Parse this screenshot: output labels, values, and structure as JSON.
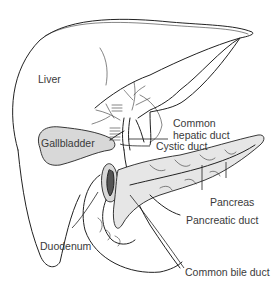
{
  "diagram": {
    "type": "anatomical-illustration",
    "labels": {
      "liver": "Liver",
      "gallbladder": "Gallbladder",
      "duodenum": "Duodenum",
      "common_hepatic_duct_line1": "Common",
      "common_hepatic_duct_line2": "hepatic duct",
      "cystic_duct": "Cystic duct",
      "pancreas": "Pancreas",
      "pancreatic_duct": "Pancreatic duct",
      "common_bile_duct": "Common bile duct"
    },
    "colors": {
      "line": "#222222",
      "label_text": "#3a3a3a",
      "fill_shade": "#d8d8d8",
      "background": "#ffffff"
    }
  }
}
